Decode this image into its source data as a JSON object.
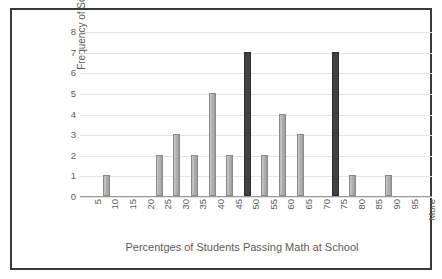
{
  "chart_data": {
    "type": "bar",
    "title": "",
    "xlabel": "Percentges of Students Passing Math at School",
    "ylabel": "Frequency of Schools",
    "categories": [
      "5",
      "10",
      "15",
      "20",
      "25",
      "30",
      "35",
      "40",
      "45",
      "50",
      "55",
      "60",
      "65",
      "70",
      "75",
      "80",
      "85",
      "90",
      "95",
      "More"
    ],
    "values": [
      0,
      1,
      0,
      0,
      2,
      3,
      2,
      5,
      2,
      7,
      2,
      4,
      3,
      0,
      7,
      1,
      0,
      1,
      0,
      0
    ],
    "highlighted": [
      "50",
      "75"
    ],
    "ylim": [
      0,
      8
    ],
    "yticks": [
      "0",
      "1",
      "2",
      "3",
      "4",
      "5",
      "6",
      "7",
      "8"
    ],
    "grid": true,
    "legend": "none",
    "colors": {
      "bar_default": "#b2b2b2",
      "bar_highlight": "#414141",
      "bar_outline": "#8a8a8a",
      "gridline": "#e2e2e2",
      "axis": "#9a9a9a",
      "text": "#5d5d5d",
      "frame": "#3a3a3a",
      "background": "#ffffff"
    }
  },
  "axis": {
    "y_title": "Frequency of Schools",
    "x_title": "Percentges of Students Passing Math at School"
  }
}
